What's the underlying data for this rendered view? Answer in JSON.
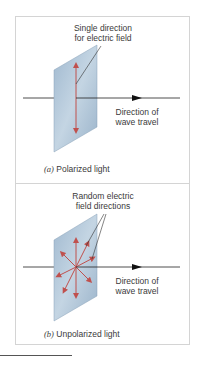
{
  "panel_a": {
    "field_label_line1": "Single direction",
    "field_label_line2": "for electric field",
    "direction_label_line1": "Direction of",
    "direction_label_line2": "wave travel",
    "caption_letter": "(a)",
    "caption_text": " Polarized light"
  },
  "panel_b": {
    "field_label_line1": "Random electric",
    "field_label_line2": "field directions",
    "direction_label_line1": "Direction of",
    "direction_label_line2": "wave travel",
    "caption_letter": "(b)",
    "caption_text": " Unpolarized light"
  },
  "colors": {
    "arrow_red": "#c0504d",
    "plate_blue": "#a9c1d6",
    "axis": "#222222",
    "border": "#d4d4d4"
  }
}
